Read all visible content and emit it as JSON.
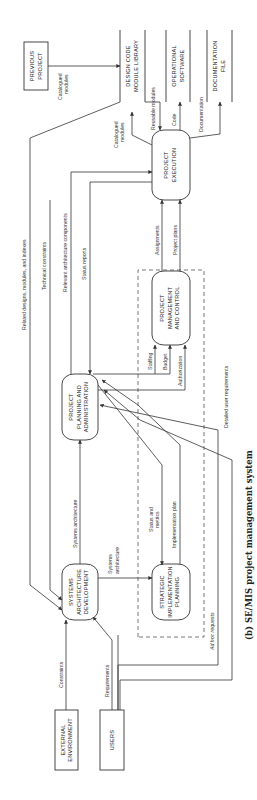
{
  "caption": "(b) SE/MIS project management system",
  "nodes": {
    "external_environment": [
      "EXTERNAL",
      "ENVIRONMENT"
    ],
    "users": [
      "USERS"
    ],
    "systems_architecture_development": [
      "SYSTEMS",
      "ARCHITECTURE",
      "DEVELOPMENT"
    ],
    "strategic_implementation_planning": [
      "STRATEGIC",
      "IMPLEMENTATION",
      "PLANNING"
    ],
    "project_planning_administration": [
      "PROJECT",
      "PLANNING AND",
      "ADMINISTRATION"
    ],
    "project_management_control": [
      "PROJECT",
      "MANAGEMENT",
      "AND CONTROL"
    ],
    "project_execution": [
      "PROJECT",
      "EXECUTION"
    ],
    "previous_project": [
      "PREVIOUS",
      "PROJECT"
    ]
  },
  "stores": {
    "design_code_library": [
      "DESIGN CODE",
      "MODULE LIBRARY"
    ],
    "operational_software": [
      "OPERATIONAL",
      "SOFTWARE"
    ],
    "documentation_file": [
      "DOCUMENTATION",
      "FILE"
    ]
  },
  "flows": {
    "constraints": "Constraints",
    "requirements": "Requirements",
    "ad_hoc_requests": "Ad hoc requests",
    "detailed_user_requirements": "Detailed user requirements",
    "systems_architecture_up": "Systems architecture",
    "systems_architecture_to_sip": [
      "Systems",
      "architecture"
    ],
    "status_and_metrics": [
      "Status and",
      "metrics"
    ],
    "implementation_plan": "Implementation plan",
    "related_designs": "Related designs, modules, and indexes",
    "technical_constraints": "Technical constraints",
    "relevant_architecture_components": "Relevant architecture components",
    "status_reports": "Status reports",
    "staffing": "Staffing",
    "budget": "Budget",
    "authorization": "Authorization",
    "assignments": "Assignments",
    "project_plans": "Project plans",
    "catalogued_modules_prev": [
      "Catalogued",
      "modules"
    ],
    "catalogued_modules_exec": [
      "Catalogued",
      "modules"
    ],
    "reusable_modules": "Reusable modules",
    "code": "Code",
    "documentation": "Documentation"
  }
}
